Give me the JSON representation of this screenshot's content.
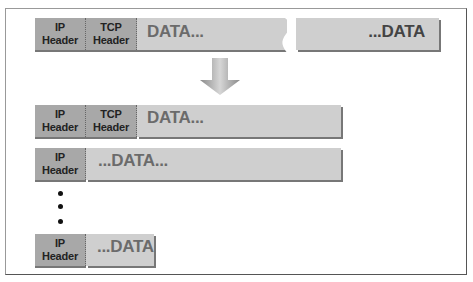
{
  "diagram": {
    "original_segment": {
      "ip_header": "IP\nHeader",
      "ip_header_line1": "IP",
      "ip_header_line2": "Header",
      "tcp_header_line1": "TCP",
      "tcp_header_line2": "Header",
      "data_start": "DATA...",
      "data_end": "...DATA"
    },
    "arrow": "down-arrow",
    "fragments": [
      {
        "ip_header_line1": "IP",
        "ip_header_line2": "Header",
        "tcp_header_line1": "TCP",
        "tcp_header_line2": "Header",
        "data": "DATA..."
      },
      {
        "ip_header_line1": "IP",
        "ip_header_line2": "Header",
        "data": "...DATA..."
      },
      {
        "ip_header_line1": "IP",
        "ip_header_line2": "Header",
        "data": "...DATA"
      }
    ],
    "ellipsis": [
      "•",
      "•",
      "•"
    ],
    "colors": {
      "header_fill": "#a8a8a8",
      "data_fill": "#cfcfcf",
      "data_text": "#6b6b6b",
      "header_text": "#222222",
      "border": "#555555"
    }
  }
}
